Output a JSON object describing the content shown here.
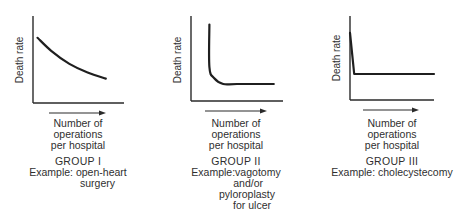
{
  "chart_data": [
    {
      "type": "line",
      "title": "GROUP I",
      "ylabel": "Death rate",
      "xlabel": "Number of operations per hospital",
      "xlabel_lines": [
        "Number of",
        "operations",
        "per hospital"
      ],
      "example_lines": [
        "Example:  open-heart",
        "surgery"
      ],
      "shape": "gradual-decline",
      "x": [
        0.05,
        0.2,
        0.4,
        0.6,
        0.8
      ],
      "y": [
        0.75,
        0.6,
        0.45,
        0.35,
        0.28
      ],
      "xlim": [
        0,
        1
      ],
      "ylim": [
        0,
        1
      ],
      "grid": false
    },
    {
      "type": "line",
      "title": "GROUP II",
      "ylabel": "Death rate",
      "xlabel": "Number of operations per hospital",
      "xlabel_lines": [
        "Number of",
        "operations",
        "per hospital"
      ],
      "example_lines": [
        "Example:vagotomy",
        "and/or",
        "pyloroplasty",
        "for ulcer"
      ],
      "shape": "sharp-drop-then-plateau",
      "x": [
        0.2,
        0.2,
        0.25,
        0.35,
        0.5,
        0.9
      ],
      "y": [
        0.9,
        0.4,
        0.27,
        0.2,
        0.2,
        0.2
      ],
      "xlim": [
        0,
        1
      ],
      "ylim": [
        0,
        1
      ],
      "grid": false
    },
    {
      "type": "line",
      "title": "GROUP III",
      "ylabel": "Death rate",
      "xlabel": "Number of operations per hospital",
      "xlabel_lines": [
        "Number of",
        "operations",
        "per hospital"
      ],
      "example_lines": [
        "Example:  cholecystecomy"
      ],
      "shape": "immediate-drop-then-flat",
      "x": [
        0.0,
        0.05,
        1.0
      ],
      "y": [
        0.8,
        0.31,
        0.31
      ],
      "xlim": [
        0,
        1
      ],
      "ylim": [
        0,
        1
      ],
      "grid": false
    }
  ]
}
